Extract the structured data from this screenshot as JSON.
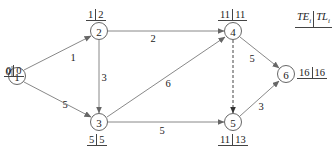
{
  "diagram": {
    "type": "activity-on-node network (critical path)",
    "legend": {
      "left": "TE",
      "left_sub": "i",
      "right": "TL",
      "right_sub": "i"
    },
    "nodes": [
      {
        "id": "1",
        "label": "1",
        "te": "0",
        "tl": "0"
      },
      {
        "id": "2",
        "label": "2",
        "te": "1",
        "tl": "2"
      },
      {
        "id": "3",
        "label": "3",
        "te": "5",
        "tl": "5"
      },
      {
        "id": "4",
        "label": "4",
        "te": "11",
        "tl": "11"
      },
      {
        "id": "5",
        "label": "5",
        "te": "11",
        "tl": "13"
      },
      {
        "id": "6",
        "label": "6",
        "te": "16",
        "tl": "16"
      }
    ],
    "edges": [
      {
        "from": "1",
        "to": "2",
        "weight": "1",
        "style": "solid"
      },
      {
        "from": "1",
        "to": "3",
        "weight": "5",
        "style": "solid"
      },
      {
        "from": "2",
        "to": "3",
        "weight": "3",
        "style": "solid"
      },
      {
        "from": "2",
        "to": "4",
        "weight": "2",
        "style": "solid"
      },
      {
        "from": "3",
        "to": "4",
        "weight": "6",
        "style": "solid"
      },
      {
        "from": "3",
        "to": "5",
        "weight": "5",
        "style": "solid"
      },
      {
        "from": "4",
        "to": "5",
        "weight": "",
        "style": "dashed"
      },
      {
        "from": "4",
        "to": "6",
        "weight": "5",
        "style": "solid"
      },
      {
        "from": "5",
        "to": "6",
        "weight": "3",
        "style": "solid"
      }
    ]
  },
  "colors": {
    "line": "#7a7a7a",
    "node_stroke": "#555555",
    "text": "#222222",
    "background": "#ffffff"
  }
}
